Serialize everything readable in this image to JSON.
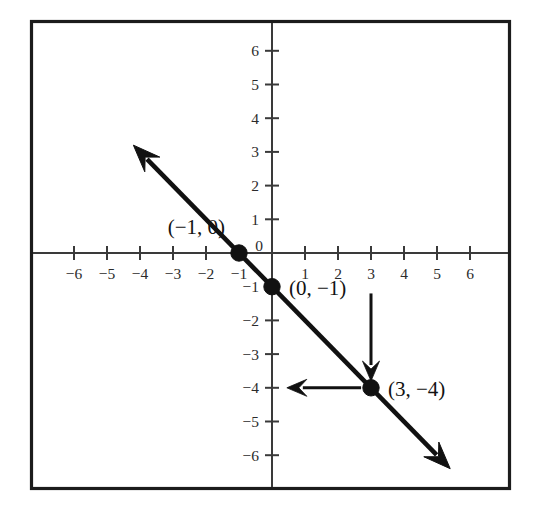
{
  "chart_data": {
    "type": "line",
    "title": "",
    "xlabel": "",
    "ylabel": "",
    "xlim": [
      -6.8,
      6.8
    ],
    "ylim": [
      -6.8,
      6.8
    ],
    "grid": false,
    "legend": false,
    "x_ticks": [
      -6,
      -5,
      -4,
      -3,
      -2,
      -1,
      0,
      1,
      2,
      3,
      4,
      5,
      6
    ],
    "y_ticks": [
      -6,
      -5,
      -4,
      -3,
      -2,
      -1,
      0,
      1,
      2,
      3,
      4,
      5,
      6
    ],
    "x_tick_labels": [
      "−6",
      "−5",
      "−4",
      "−3",
      "−2",
      "−1",
      "0",
      "1",
      "2",
      "3",
      "4",
      "5",
      "6"
    ],
    "y_tick_labels": [
      "−6",
      "−5",
      "−4",
      "−3",
      "−2",
      "−1",
      "0",
      "1",
      "2",
      "3",
      "4",
      "5",
      "6"
    ],
    "origin_label": "0",
    "series": [
      {
        "name": "line",
        "equation": "y = -x - 1",
        "slope": -1,
        "intercept": -1,
        "x": [
          -4.2,
          5.4
        ],
        "y": [
          3.2,
          -6.4
        ],
        "arrow_start": true,
        "arrow_end": true,
        "color": "#111111"
      }
    ],
    "points": [
      {
        "x": -1,
        "y": 0,
        "label": "(−1, 0)",
        "label_position": "above-left"
      },
      {
        "x": 0,
        "y": -1,
        "label": "(0, −1)",
        "label_position": "right"
      },
      {
        "x": 3,
        "y": -4,
        "label": "(3, −4)",
        "label_position": "right"
      }
    ],
    "annotations": [
      {
        "name": "vertical-drop-arrow",
        "kind": "arrow",
        "from": {
          "x": 3,
          "y": -1.2
        },
        "to": {
          "x": 3,
          "y": -3.8
        },
        "direction": "down"
      },
      {
        "name": "horizontal-run-arrow",
        "kind": "arrow",
        "from": {
          "x": 2.7,
          "y": -4
        },
        "to": {
          "x": 0.45,
          "y": -4
        },
        "direction": "left"
      }
    ]
  },
  "figure": {
    "background_color": "#ffffff",
    "frame_color": "#1c1c1c",
    "axis_color": "#3a3a3a",
    "ink_color": "#111111"
  }
}
